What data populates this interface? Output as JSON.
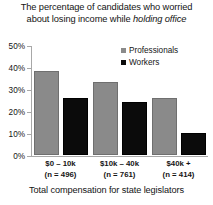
{
  "chart_data": {
    "type": "bar",
    "title": "The percentage of candidates who worried about losing income while holding office",
    "title_line1": "The percentage of candidates who worried",
    "title_line2_plain": "about losing income while ",
    "title_line2_italic": "holding office",
    "xlabel": "Total compensation for state legislators",
    "ylabel": "",
    "ylim": [
      0,
      50
    ],
    "yticks": [
      0,
      10,
      20,
      30,
      40,
      50
    ],
    "ytick_labels": [
      "0%",
      "10%",
      "20%",
      "30%",
      "40%",
      "50%"
    ],
    "grid": false,
    "legend_position": "top-right",
    "categories": [
      "$0 – 10k",
      "$10k – 40k",
      "$40k +"
    ],
    "category_counts": [
      "(n = 496)",
      "(n = 761)",
      "(n = 414)"
    ],
    "series": [
      {
        "name": "Professionals",
        "color": "#8a8a8a",
        "values": [
          38,
          33,
          26
        ]
      },
      {
        "name": "Workers",
        "color": "#0b0b0b",
        "values": [
          26,
          24,
          10
        ]
      }
    ]
  },
  "legend": {
    "items": [
      {
        "label": "Professionals",
        "swatch": "professionals"
      },
      {
        "label": "Workers",
        "swatch": "workers"
      }
    ]
  }
}
